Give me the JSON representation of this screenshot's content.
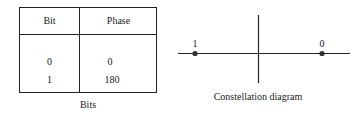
{
  "table": {
    "headers": [
      "Bit",
      "Phase"
    ],
    "rows": [
      [
        "0",
        "0"
      ],
      [
        "1",
        "180"
      ]
    ],
    "caption": "Bits"
  },
  "constellation": {
    "points": [
      {
        "label": "1",
        "phase": 180
      },
      {
        "label": "0",
        "phase": 0
      }
    ],
    "caption": "Constellation diagram"
  }
}
